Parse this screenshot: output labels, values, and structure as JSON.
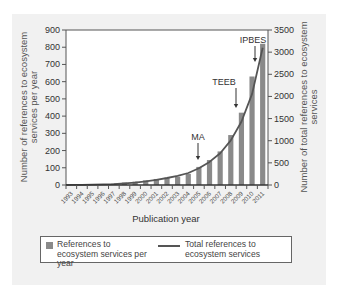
{
  "chart_data": {
    "type": "bar",
    "title": "",
    "xlabel": "Publication year",
    "ylabel": "Number of references to ecosystem services per year",
    "y2label": "Number of total references to ecosystem services",
    "categories": [
      "1993",
      "1994",
      "1995",
      "1996",
      "1997",
      "1998",
      "1999",
      "2000",
      "2001",
      "2002",
      "2003",
      "2004",
      "2005",
      "2006",
      "2007",
      "2008",
      "2009",
      "2010",
      "2011"
    ],
    "series": [
      {
        "name": "References to ecosystem services per year",
        "type": "bar",
        "axis": "left",
        "values": [
          2,
          3,
          3,
          5,
          8,
          14,
          20,
          27,
          35,
          42,
          48,
          65,
          105,
          145,
          195,
          290,
          420,
          630,
          820
        ]
      },
      {
        "name": "Total references to ecosystem services",
        "type": "line",
        "axis": "right",
        "values": [
          2,
          5,
          8,
          13,
          21,
          35,
          55,
          82,
          117,
          159,
          207,
          272,
          377,
          522,
          717,
          1007,
          1427,
          2057,
          3100
        ]
      }
    ],
    "ylim": [
      0,
      900
    ],
    "y2lim": [
      0,
      3500
    ],
    "yticks": [
      0,
      100,
      200,
      300,
      400,
      500,
      600,
      700,
      800,
      900
    ],
    "y2ticks": [
      0,
      500,
      1000,
      1500,
      2000,
      2500,
      3000,
      3500
    ],
    "annotations": [
      {
        "label": "MA",
        "x": "2005"
      },
      {
        "label": "TEEB",
        "x": "2010"
      },
      {
        "label": "IPBES",
        "x": "2011"
      }
    ],
    "grid": false,
    "legend_position": "bottom"
  },
  "legend": {
    "bar_label": "References to ecosystem services per year",
    "line_label": "Total references to ecosystem services"
  },
  "colors": {
    "bar": "#8a8a8a",
    "line": "#555555",
    "panel": "#f1f1f1"
  }
}
